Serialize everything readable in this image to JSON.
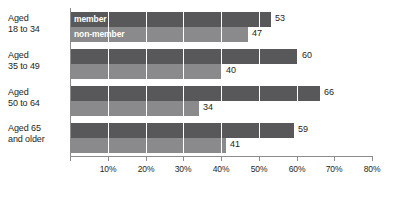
{
  "chart_data": {
    "type": "bar",
    "orientation": "horizontal",
    "title": "",
    "subtitle": "",
    "xlabel": "",
    "ylabel": "",
    "categories": [
      "Aged 18 to 34",
      "Aged 35 to 49",
      "Aged 50 to 64",
      "Aged 65 and older"
    ],
    "series": [
      {
        "name": "member",
        "values": [
          53,
          60,
          66,
          59
        ],
        "color": "#58585a"
      },
      {
        "name": "non-member",
        "values": [
          47,
          40,
          34,
          41
        ],
        "color": "#8a8a8c"
      }
    ],
    "xlim": [
      0,
      80
    ],
    "xtick_labels": [
      "10%",
      "20%",
      "30%",
      "40%",
      "50%",
      "60%",
      "70%",
      "80%"
    ],
    "xtick_values": [
      10,
      20,
      30,
      40,
      50,
      60,
      70,
      80
    ],
    "grid": true,
    "grid_axis": "x",
    "legend_position": "in-bars-first-group",
    "value_labels": [
      [
        "53",
        "47"
      ],
      [
        "60",
        "40"
      ],
      [
        "66",
        "34"
      ],
      [
        "59",
        "41"
      ]
    ]
  },
  "categories": {
    "g1": {
      "line1": "Aged",
      "line2": "18 to 34"
    },
    "g2": {
      "line1": "Aged",
      "line2": "35 to 49"
    },
    "g3": {
      "line1": "Aged",
      "line2": "50 to 64"
    },
    "g4": {
      "line1": "Aged 65",
      "line2": "and older"
    }
  },
  "legend": {
    "member": "member",
    "nonmember": "non-member"
  },
  "ticks": {
    "t10": "10%",
    "t20": "20%",
    "t30": "30%",
    "t40": "40%",
    "t50": "50%",
    "t60": "60%",
    "t70": "70%",
    "t80": "80%"
  },
  "values": {
    "g1_member": "53",
    "g1_nonmember": "47",
    "g2_member": "60",
    "g2_nonmember": "40",
    "g3_member": "66",
    "g3_nonmember": "34",
    "g4_member": "59",
    "g4_nonmember": "41"
  }
}
